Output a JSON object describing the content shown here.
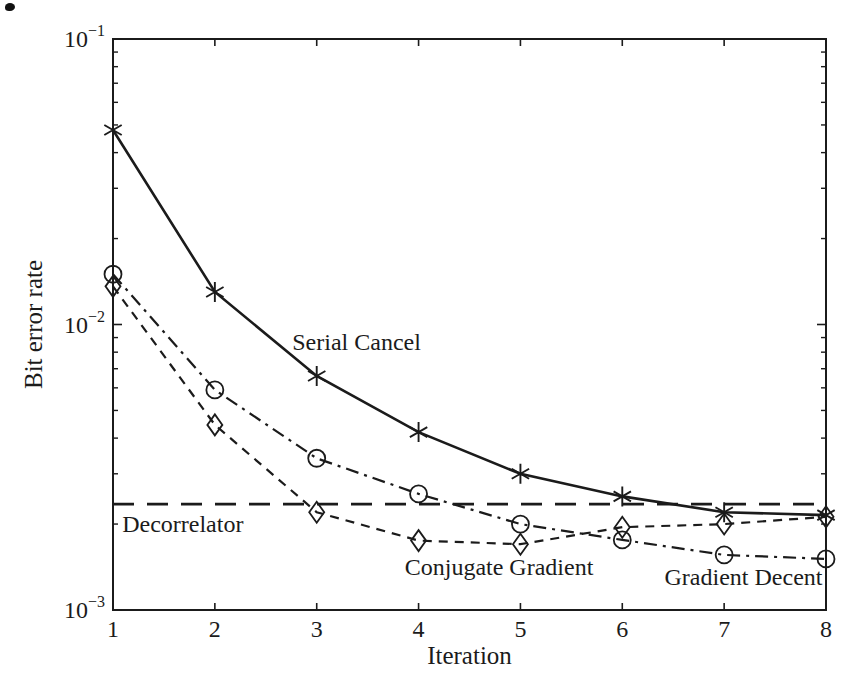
{
  "figure": {
    "background": "#ffffff",
    "ink_color": "#1b1b1b"
  },
  "chart_data": {
    "type": "line",
    "title": "",
    "xlabel": "Iteration",
    "ylabel": "Bit error rate",
    "x_range": [
      1,
      8
    ],
    "ylim": [
      0.001,
      0.1
    ],
    "y_scale": "log",
    "grid": false,
    "legend_position": "inline-annotations",
    "x": [
      1,
      2,
      3,
      4,
      5,
      6,
      7,
      8
    ],
    "x_ticks": [
      "1",
      "2",
      "3",
      "4",
      "5",
      "6",
      "7",
      "8"
    ],
    "y_ticks": [
      {
        "base": "10",
        "exp": "−1",
        "value": 0.1
      },
      {
        "base": "10",
        "exp": "−2",
        "value": 0.01
      },
      {
        "base": "10",
        "exp": "−3",
        "value": 0.001
      }
    ],
    "series": [
      {
        "name": "Serial Cancel",
        "marker": "asterisk",
        "line_style": "solid",
        "values": [
          0.048,
          0.013,
          0.0066,
          0.0042,
          0.003,
          0.0025,
          0.0022,
          0.00215
        ]
      },
      {
        "name": "Gradient Decent",
        "marker": "circle",
        "line_style": "dash-dot",
        "values": [
          0.015,
          0.0059,
          0.0034,
          0.00255,
          0.002,
          0.00176,
          0.00156,
          0.00151
        ]
      },
      {
        "name": "Conjugate Gradient",
        "marker": "diamond",
        "line_style": "dashed",
        "values": [
          0.0136,
          0.00445,
          0.0022,
          0.00175,
          0.0017,
          0.00195,
          0.002,
          0.00212
        ]
      }
    ],
    "reference_line": {
      "name": "Decorrelator",
      "value": 0.00235,
      "line_style": "long-dash"
    },
    "annotations": [
      {
        "text": "Serial Cancel",
        "x": 2.76,
        "y": 0.0087,
        "anchor": "start"
      },
      {
        "text": "Decorrelator",
        "x": 1.09,
        "y": 0.002,
        "anchor": "start"
      },
      {
        "text": "Conjugate Gradient",
        "x": 4.79,
        "y": 0.00142,
        "anchor": "middle"
      },
      {
        "text": "Gradient Decent",
        "x": 7.19,
        "y": 0.0013,
        "anchor": "middle"
      }
    ]
  }
}
